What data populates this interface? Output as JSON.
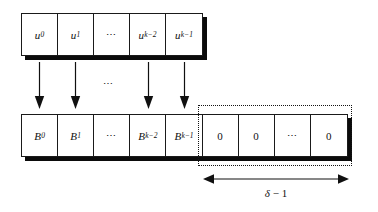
{
  "figure": {
    "ink_color": "#101010",
    "shadow_color": "#0b0b0b",
    "background": "#ffffff"
  },
  "top_row": {
    "name": "input-word-row",
    "cells": [
      {
        "base": "u",
        "sub": "0",
        "text": "u0"
      },
      {
        "base": "u",
        "sub": "1",
        "text": "u1"
      },
      {
        "base": "",
        "sub": "",
        "text": "⋯"
      },
      {
        "base": "u",
        "sub": "k−2",
        "text": "uk-2"
      },
      {
        "base": "u",
        "sub": "k−1",
        "text": "uk-1"
      }
    ]
  },
  "bottom_row": {
    "name": "encoded-block-row",
    "cells": [
      {
        "base": "B",
        "sub": "0",
        "text": "B0"
      },
      {
        "base": "B",
        "sub": "1",
        "text": "B1"
      },
      {
        "base": "",
        "sub": "",
        "text": "⋯"
      },
      {
        "base": "B",
        "sub": "k−2",
        "text": "Bk-2"
      },
      {
        "base": "B",
        "sub": "k−1",
        "text": "Bk-1"
      },
      {
        "base": "0",
        "sub": "",
        "text": "0"
      },
      {
        "base": "0",
        "sub": "",
        "text": "0"
      },
      {
        "base": "",
        "sub": "",
        "text": "⋯"
      },
      {
        "base": "0",
        "sub": "",
        "text": "0"
      }
    ]
  },
  "mid_ellipsis": "⋯",
  "arrows": {
    "count": 4,
    "positions": [
      39,
      75,
      148,
      184
    ]
  },
  "measure": {
    "label_symbol": "δ",
    "label_rest": " − 1",
    "label_full": "δ − 1"
  }
}
